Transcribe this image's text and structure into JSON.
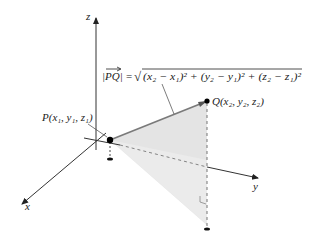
{
  "diagram": {
    "axes": {
      "z_label": "z",
      "y_label": "y",
      "x_label": "x"
    },
    "points": {
      "P": {
        "name": "P",
        "coords_label": "(x₁, y₁, z₁)",
        "full_label": "P(x₁, y₁, z₁)"
      },
      "Q": {
        "name": "Q",
        "coords_label": "(x₂, y₂, z₂)",
        "full_label": "Q(x₂, y₂, z₂)"
      }
    },
    "formula": {
      "lhs": "|PQ|",
      "equals": "=",
      "radical": "√",
      "radicand": "(x₂ − x₁)² + (y₂ − y₁)² + (z₂ − z₁)²",
      "full": "|PQ| = √((x₂ − x₁)² + (y₂ − y₁)² + (z₂ − z₁)²)"
    },
    "colors": {
      "axis": "#333333",
      "shade": "#e6e6e6",
      "segment": "#7a7a7a",
      "dashed": "#666666",
      "point": "#000000"
    }
  }
}
